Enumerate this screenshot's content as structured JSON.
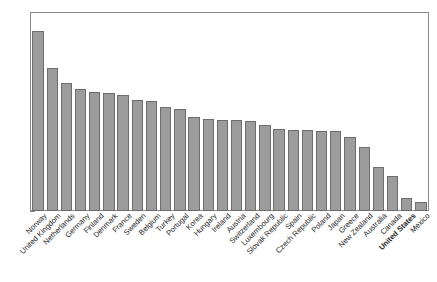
{
  "chart_data": {
    "type": "bar",
    "title": "",
    "subtitle": "",
    "xlabel": "",
    "ylabel": "",
    "ylim": [
      0,
      6
    ],
    "yticks": [
      0,
      1,
      2,
      3,
      4,
      5,
      6
    ],
    "ytick_labels": [
      "0",
      "1",
      "2",
      "3",
      "4",
      "5",
      "6"
    ],
    "grid": false,
    "legend": null,
    "bar_color": "#9c9c9c",
    "bar_edge_color": "#6d6d6d",
    "highlight_category": "United States",
    "categories": [
      "Norway",
      "United Kingdom",
      "Netherlands",
      "Germany",
      "Finland",
      "Denmark",
      "France",
      "Sweden",
      "Belgium",
      "Turkey",
      "Portugal",
      "Korea",
      "Hungary",
      "Ireland",
      "Austria",
      "Switzerland",
      "Luxembourg",
      "Slovak Republic",
      "Spain",
      "Czech Republic",
      "Poland",
      "Japan",
      "Greece",
      "New Zealand",
      "Australia",
      "Canada",
      "United States",
      "Mexico"
    ],
    "values": [
      5.45,
      4.32,
      3.89,
      3.71,
      3.6,
      3.57,
      3.53,
      3.37,
      3.33,
      3.15,
      3.1,
      2.84,
      2.78,
      2.77,
      2.76,
      2.72,
      2.6,
      2.5,
      2.46,
      2.44,
      2.43,
      2.43,
      2.25,
      1.95,
      1.33,
      1.07,
      0.38,
      0.27
    ]
  }
}
